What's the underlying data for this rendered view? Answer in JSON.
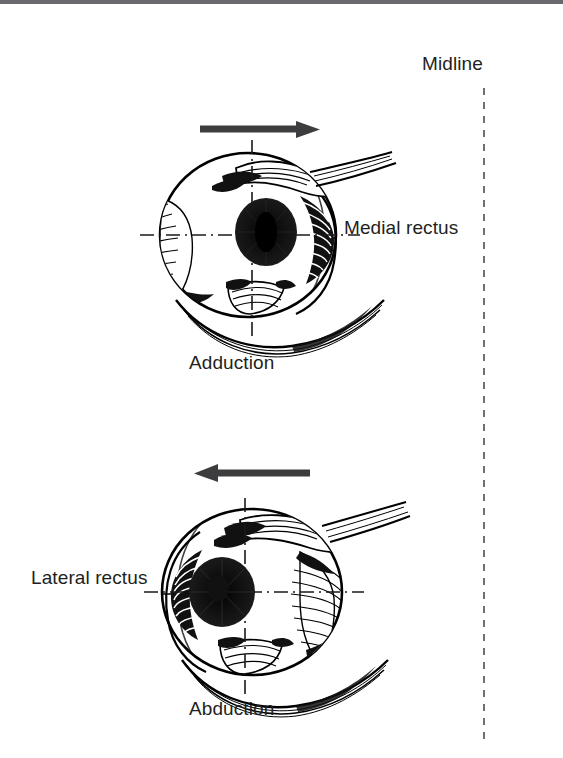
{
  "figure": {
    "background_color": "#ffffff",
    "ink_color": "#000000",
    "text_color": "#231f20",
    "width": 563,
    "height": 758
  },
  "midline": {
    "label": "Midline",
    "style": "dashed-vertical",
    "x": 484,
    "y_top": 88,
    "y_bottom": 742,
    "color": "#4d4d4d"
  },
  "panels": [
    {
      "id": "adduction",
      "caption": "Adduction",
      "muscle_label": "Medial rectus",
      "muscle_label_side": "right",
      "arrow": {
        "direction": "right",
        "meaning": "eye rotates toward midline",
        "x_start": 200,
        "x_end": 312,
        "y": 129,
        "color": "#3d3d3f"
      },
      "eye": {
        "center_x": 248,
        "center_y": 235,
        "radius_x": 88,
        "radius_y": 82,
        "iris_center_x": 266,
        "iris_center_y": 232,
        "iris_radius": 31,
        "pupil_radius": 12,
        "gaze": "toward-midline",
        "axis_horizontal_y": 235,
        "axis_vertical_x": 252
      },
      "muscles": [
        "medial rectus",
        "lateral rectus",
        "superior oblique",
        "inferior oblique"
      ]
    },
    {
      "id": "abduction",
      "caption": "Abduction",
      "muscle_label": "Lateral rectus",
      "muscle_label_side": "left",
      "arrow": {
        "direction": "left",
        "meaning": "eye rotates away from midline",
        "x_start": 310,
        "x_end": 196,
        "y": 473,
        "color": "#3d3d3f"
      },
      "eye": {
        "center_x": 252,
        "center_y": 592,
        "radius_x": 90,
        "radius_y": 83,
        "iris_center_x": 222,
        "iris_center_y": 592,
        "iris_radius": 33,
        "pupil_radius": 12,
        "gaze": "away-from-midline",
        "axis_horizontal_y": 592,
        "axis_vertical_x": 245
      },
      "muscles": [
        "lateral rectus",
        "medial rectus",
        "superior oblique",
        "inferior oblique"
      ]
    }
  ],
  "header_band": {
    "color": "#6a6a6e",
    "height": 4
  }
}
